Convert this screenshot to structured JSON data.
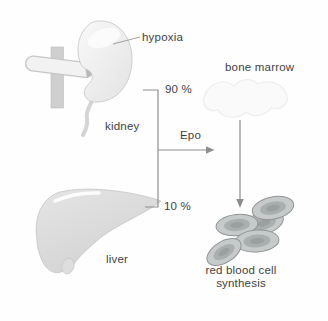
{
  "diagram": {
    "labels": {
      "hypoxia": "hypoxia",
      "kidney": "kidney",
      "liver": "liver",
      "bone_marrow": "bone marrow",
      "epo": "Epo",
      "kidney_percent": "90 %",
      "liver_percent": "10 %",
      "rbc_line1": "red blood cell",
      "rbc_line2": "synthesis"
    },
    "edges": [
      {
        "from": "kidney",
        "to": "Epo",
        "label": "90 %"
      },
      {
        "from": "liver",
        "to": "Epo",
        "label": "10 %"
      },
      {
        "from": "Epo",
        "to": "bone marrow"
      },
      {
        "from": "bone marrow",
        "to": "red blood cell synthesis"
      }
    ],
    "colors": {
      "text": "#3e3e3e",
      "line": "#8e8e8e",
      "organ_edge": "#c4c4c4",
      "organ_light": "#f1f1f1",
      "liver_fill": "#d9d9d9",
      "vessel_fill": "#cfcfcf",
      "tube_fill": "#f2f2f2",
      "faint_bone": "#ededed",
      "cell_fill": "#c6caca",
      "cell_ring": "#a9afaf",
      "cell_core": "#99a0a0",
      "cell_edge": "#8d9393"
    }
  }
}
